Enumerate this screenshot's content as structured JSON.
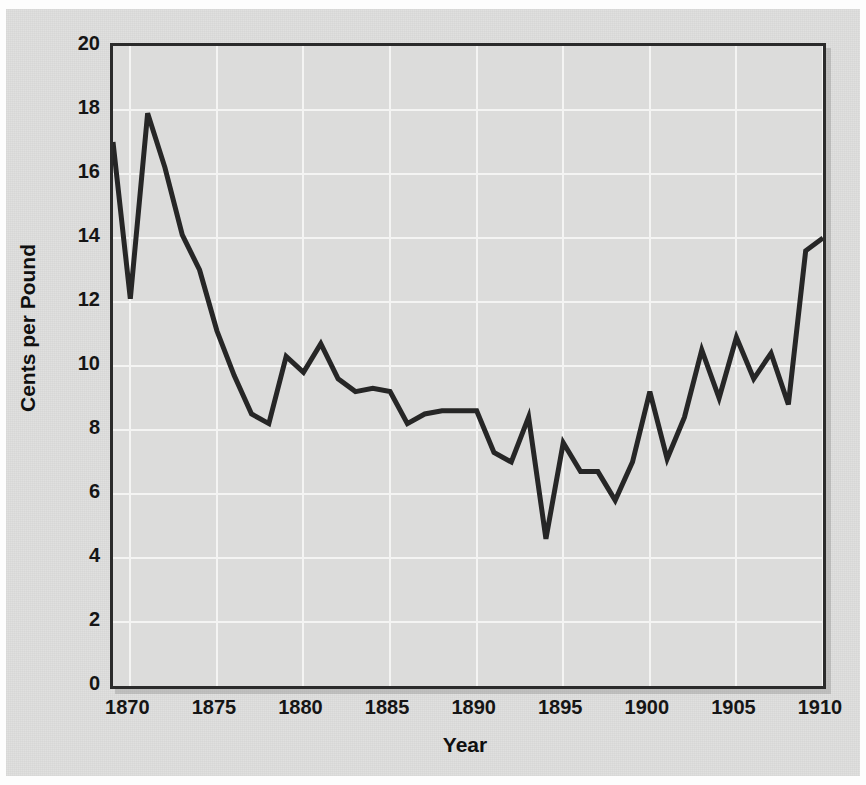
{
  "chart_data": {
    "type": "line",
    "title": "",
    "xlabel": "Year",
    "ylabel": "Cents per Pound",
    "xlim": [
      1869,
      1910
    ],
    "ylim": [
      0,
      20
    ],
    "xticks": [
      "1870",
      "1875",
      "1880",
      "1885",
      "1890",
      "1895",
      "1900",
      "1905",
      "1910"
    ],
    "xtick_values": [
      1870,
      1875,
      1880,
      1885,
      1890,
      1895,
      1900,
      1905,
      1910
    ],
    "yticks": [
      "0",
      "2",
      "4",
      "6",
      "8",
      "10",
      "12",
      "14",
      "16",
      "18",
      "20"
    ],
    "ytick_values": [
      0,
      2,
      4,
      6,
      8,
      10,
      12,
      14,
      16,
      18,
      20
    ],
    "grid": true,
    "grid_color": "#f4f4f3",
    "legend": "none",
    "line_color": "#262626",
    "background_color": "#dcdcdb",
    "frame_color": "#2b2b2b",
    "x": [
      1869,
      1870,
      1871,
      1872,
      1873,
      1874,
      1875,
      1876,
      1877,
      1878,
      1879,
      1880,
      1881,
      1882,
      1883,
      1884,
      1885,
      1886,
      1887,
      1888,
      1889,
      1890,
      1891,
      1892,
      1893,
      1894,
      1895,
      1896,
      1897,
      1898,
      1899,
      1900,
      1901,
      1902,
      1903,
      1904,
      1905,
      1906,
      1907,
      1908,
      1909,
      1910
    ],
    "values": [
      17.0,
      12.1,
      17.9,
      16.2,
      14.1,
      13.0,
      11.1,
      9.7,
      8.5,
      8.2,
      10.3,
      9.8,
      10.7,
      9.6,
      9.2,
      9.3,
      9.2,
      8.2,
      8.5,
      8.6,
      8.6,
      8.6,
      7.3,
      7.0,
      8.4,
      4.6,
      7.6,
      6.7,
      6.7,
      5.8,
      7.0,
      9.2,
      7.1,
      8.4,
      10.5,
      9.0,
      10.9,
      9.6,
      10.4,
      8.8,
      13.6,
      14.0
    ],
    "series_name": "Cents per Pound"
  },
  "axes": {
    "y_title": "Cents per Pound",
    "x_title": "Year"
  }
}
